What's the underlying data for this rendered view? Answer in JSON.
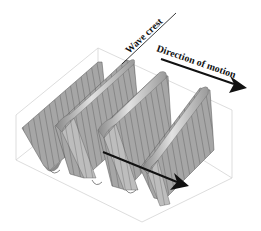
{
  "diagram": {
    "type": "3d-surface-wave",
    "labels": {
      "wave_crest": "Wave crest",
      "direction_of_motion": "Direction of motion"
    },
    "colors": {
      "surface": "#a9a9a9",
      "surface_light": "#d6d6d6",
      "surface_dark": "#7d7d7d",
      "mesh_line": "#3a3a3a",
      "box_edge": "#d0d0d0",
      "arrow": "#111111",
      "background": "#ffffff"
    },
    "crest_count": 4,
    "arrows": [
      {
        "name": "direction-arrow-top",
        "from": [
          161,
          58
        ],
        "to": [
          246,
          88
        ]
      },
      {
        "name": "direction-arrow-bottom",
        "from": [
          103,
          152
        ],
        "to": [
          188,
          186
        ]
      }
    ]
  }
}
